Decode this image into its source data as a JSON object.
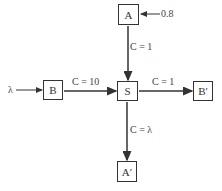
{
  "nodes": {
    "A": "A",
    "S": "S",
    "B": "B",
    "B_prime": "B′",
    "A_prime": "A′"
  },
  "inputs": {
    "A_input": "0.8",
    "B_input": "λ"
  },
  "edges": {
    "A_to_S": "C = 1",
    "B_to_S": "C = 10",
    "S_to_B_prime": "C = 1",
    "S_to_A_prime": "C = λ"
  },
  "colors": {
    "stroke": "#333333",
    "background": "#ffffff"
  }
}
